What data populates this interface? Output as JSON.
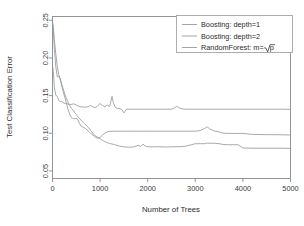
{
  "chart_data": {
    "type": "line",
    "title": "",
    "xlabel": "Number of Trees",
    "ylabel": "Test Classification Error",
    "xlim": [
      0,
      5000
    ],
    "ylim": [
      0.04,
      0.255
    ],
    "grid": false,
    "legend_position": "top-right",
    "xticks": [
      0,
      1000,
      2000,
      3000,
      4000,
      5000
    ],
    "xticklabels": [
      "0",
      "1000",
      "2000",
      "3000",
      "4000",
      "5000"
    ],
    "yticks": [
      0.05,
      0.1,
      0.15,
      0.2,
      0.25
    ],
    "yticklabels": [
      "0.05",
      "0.10",
      "0.15",
      "0.20",
      "0.25"
    ],
    "series": [
      {
        "name": "Boosting: depth=1",
        "color": "#9a9a9a",
        "x": [
          10,
          40,
          70,
          100,
          130,
          160,
          200,
          240,
          280,
          320,
          360,
          400,
          440,
          480,
          520,
          560,
          600,
          650,
          700,
          750,
          800,
          850,
          900,
          950,
          1000,
          1050,
          1100,
          1150,
          1200,
          1250,
          1300,
          1400,
          1500,
          1600,
          1700,
          1800,
          1850,
          1900,
          1950,
          2000,
          2100,
          2200,
          2300,
          2400,
          2500,
          2600,
          2700,
          2800,
          2900,
          3000,
          3100,
          3200,
          3250,
          3300,
          3400,
          3500,
          3600,
          3700,
          3800,
          3900,
          4000,
          4200,
          4500,
          4800,
          5000
        ],
        "y": [
          0.2455,
          0.224,
          0.205,
          0.189,
          0.178,
          0.173,
          0.164,
          0.156,
          0.148,
          0.142,
          0.137,
          0.133,
          0.13,
          0.1265,
          0.123,
          0.12,
          0.1175,
          0.114,
          0.111,
          0.108,
          0.104,
          0.1,
          0.0965,
          0.0945,
          0.093,
          0.0905,
          0.089,
          0.0875,
          0.0865,
          0.0858,
          0.085,
          0.0832,
          0.082,
          0.0815,
          0.0818,
          0.084,
          0.0825,
          0.0855,
          0.083,
          0.0822,
          0.082,
          0.0822,
          0.082,
          0.0818,
          0.082,
          0.0822,
          0.0822,
          0.083,
          0.0845,
          0.0862,
          0.0862,
          0.0862,
          0.087,
          0.0868,
          0.0868,
          0.0862,
          0.085,
          0.0848,
          0.0848,
          0.0848,
          0.0805,
          0.0802,
          0.0802,
          0.0802,
          0.08
        ]
      },
      {
        "name": "Boosting: depth=2",
        "color": "#9a9a9a",
        "x": [
          10,
          40,
          70,
          100,
          130,
          160,
          200,
          240,
          280,
          320,
          360,
          400,
          440,
          480,
          520,
          560,
          600,
          650,
          700,
          750,
          800,
          850,
          900,
          950,
          1000,
          1050,
          1100,
          1150,
          1200,
          1300,
          1400,
          1600,
          1800,
          2000,
          2200,
          2400,
          2600,
          2800,
          3000,
          3100,
          3200,
          3250,
          3300,
          3400,
          3500,
          3600,
          3800,
          4000,
          4200,
          4500,
          4800,
          5000
        ],
        "y": [
          0.243,
          0.211,
          0.188,
          0.175,
          0.176,
          0.172,
          0.161,
          0.152,
          0.143,
          0.133,
          0.1255,
          0.1205,
          0.1195,
          0.1195,
          0.1195,
          0.114,
          0.1095,
          0.108,
          0.106,
          0.103,
          0.1,
          0.0975,
          0.095,
          0.0935,
          0.0945,
          0.0975,
          0.1,
          0.1018,
          0.1025,
          0.1028,
          0.1028,
          0.1028,
          0.1028,
          0.1028,
          0.1028,
          0.1028,
          0.1028,
          0.1028,
          0.1028,
          0.1035,
          0.1065,
          0.1085,
          0.106,
          0.103,
          0.1018,
          0.1,
          0.0998,
          0.0998,
          0.0985,
          0.0982,
          0.098,
          0.0978
        ]
      },
      {
        "name": "RandomForest: m=sqrt(p)",
        "color": "#9a9a9a",
        "x": [
          10,
          40,
          70,
          100,
          130,
          160,
          200,
          240,
          280,
          320,
          360,
          400,
          450,
          500,
          550,
          600,
          650,
          700,
          750,
          800,
          850,
          900,
          950,
          1000,
          1050,
          1100,
          1150,
          1200,
          1250,
          1280,
          1320,
          1360,
          1400,
          1450,
          1500,
          1550,
          1600,
          1700,
          1900,
          2100,
          2300,
          2500,
          2550,
          2600,
          2650,
          2700,
          2800,
          3000,
          3200,
          3400,
          3600,
          3800,
          4000,
          4200,
          4500,
          4800,
          5000
        ],
        "y": [
          0.187,
          0.161,
          0.1505,
          0.149,
          0.144,
          0.142,
          0.142,
          0.14,
          0.1395,
          0.139,
          0.138,
          0.1385,
          0.139,
          0.1375,
          0.136,
          0.135,
          0.135,
          0.1345,
          0.1355,
          0.137,
          0.135,
          0.134,
          0.1365,
          0.1395,
          0.137,
          0.135,
          0.1375,
          0.1355,
          0.149,
          0.14,
          0.1345,
          0.133,
          0.133,
          0.132,
          0.127,
          0.1318,
          0.132,
          0.132,
          0.132,
          0.132,
          0.132,
          0.132,
          0.133,
          0.1355,
          0.1345,
          0.1325,
          0.132,
          0.132,
          0.132,
          0.132,
          0.132,
          0.132,
          0.132,
          0.132,
          0.132,
          0.132,
          0.1318
        ]
      }
    ],
    "legend": [
      {
        "label": "Boosting: depth=1",
        "color": "#9a9a9a"
      },
      {
        "label": "Boosting: depth=2",
        "color": "#9a9a9a"
      },
      {
        "label": "RandomForest: m=",
        "color": "#9a9a9a",
        "math_suffix": "p"
      }
    ]
  }
}
